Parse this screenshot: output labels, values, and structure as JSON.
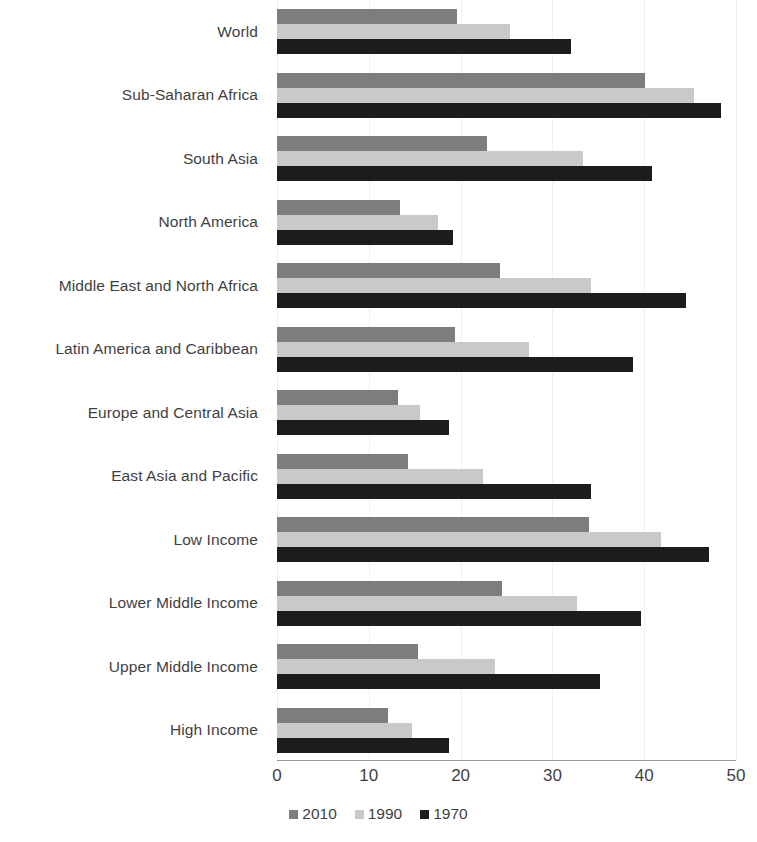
{
  "chart_data": {
    "type": "bar",
    "orientation": "horizontal",
    "title": "",
    "subtitle": "",
    "xlabel": "",
    "ylabel": "",
    "xlim": [
      0,
      50
    ],
    "xticks": [
      0,
      10,
      20,
      30,
      40,
      50
    ],
    "xtick_labels": [
      "0",
      "10",
      "20",
      "30",
      "40",
      "50"
    ],
    "grid": true,
    "grid_axis": "x",
    "legend_position": "bottom",
    "categories": [
      "World",
      "Sub-Saharan Africa",
      "South Asia",
      "North America",
      "Middle East and North Africa",
      "Latin America and Caribbean",
      "Europe and Central Asia",
      "East Asia and Pacific",
      "Low Income",
      "Lower Middle Income",
      "Upper Middle Income",
      "High Income"
    ],
    "series": [
      {
        "name": "2010",
        "color": "#7d7d7d",
        "values": [
          19.6,
          40.1,
          22.9,
          13.4,
          24.3,
          19.4,
          13.2,
          14.3,
          34.0,
          24.5,
          15.4,
          12.1
        ]
      },
      {
        "name": "1990",
        "color": "#c9c9c9",
        "values": [
          25.4,
          45.4,
          33.3,
          17.5,
          34.2,
          27.4,
          15.6,
          22.4,
          41.8,
          32.7,
          23.8,
          14.7
        ]
      },
      {
        "name": "1970",
        "color": "#1c1c1c",
        "values": [
          32.0,
          48.4,
          40.9,
          19.2,
          44.5,
          38.8,
          18.7,
          34.2,
          47.1,
          39.6,
          35.2,
          18.7
        ]
      }
    ]
  }
}
